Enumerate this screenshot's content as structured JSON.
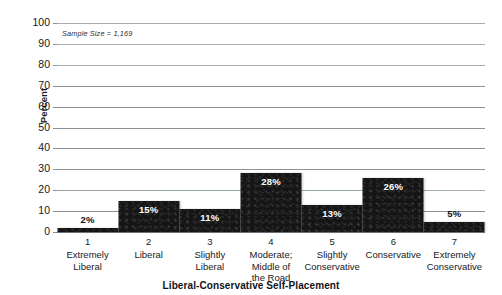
{
  "chart_data": {
    "type": "bar",
    "title": "",
    "xlabel": "Liberal-Conservative Self-Placement",
    "ylabel": "Percent",
    "ylim": [
      0,
      100
    ],
    "ytick_step": 10,
    "yticks": [
      "100",
      "90",
      "80",
      "70",
      "60",
      "50",
      "40",
      "30",
      "20",
      "10",
      "0"
    ],
    "grid": "horizontal",
    "legend": "none",
    "annotation": "Sample Size = 1,169",
    "categories": [
      "1\nExtremely\nLiberal",
      "2\nLiberal",
      "3\nSlightly\nLiberal",
      "4\nModerate;\nMiddle of\nthe Road",
      "5\nSlightly\nConservative",
      "6\nConservative",
      "7\nExtremely\nConservative"
    ],
    "values": [
      2,
      15,
      11,
      28,
      13,
      26,
      5
    ],
    "value_labels": [
      "2%",
      "15%",
      "11%",
      "28%",
      "13%",
      "26%",
      "5%"
    ],
    "label_position": [
      "above",
      "inside",
      "inside",
      "inside",
      "inside",
      "inside",
      "above"
    ],
    "bar_color": "#151515",
    "gridline_color": "#8d9096",
    "text_color": "#17191c"
  },
  "axes": {
    "category_numbers": [
      "1",
      "2",
      "3",
      "4",
      "5",
      "6",
      "7"
    ],
    "category_names": [
      "Extremely\nLiberal",
      "Liberal",
      "Slightly\nLiberal",
      "Moderate;\nMiddle of\nthe Road",
      "Slightly\nConservative",
      "Conservative",
      "Extremely\nConservative"
    ]
  }
}
